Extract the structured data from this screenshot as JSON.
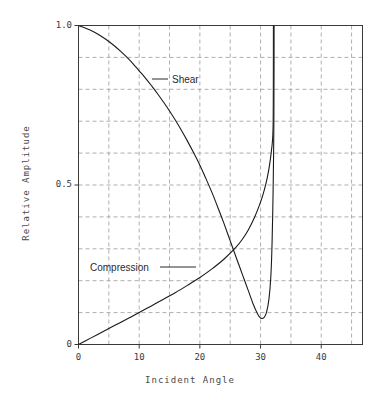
{
  "chart_data": {
    "type": "line",
    "title": "",
    "xlabel": "Incident Angle",
    "ylabel": "Relative Amplitude",
    "xlim": [
      0,
      46.8
    ],
    "ylim": [
      0,
      1.0
    ],
    "grid": true,
    "grid_x_step": 5,
    "grid_y_step": 0.1,
    "x_ticks": [
      0,
      10,
      20,
      30,
      40
    ],
    "x_tick_labels": [
      "0",
      "10",
      "20",
      "30",
      "40"
    ],
    "y_ticks": [
      0,
      0.5,
      1.0
    ],
    "y_tick_labels": [
      "0",
      "0.5",
      "1.0"
    ],
    "legend_position": "inline-annotations",
    "annotations": [
      {
        "name": "Shear",
        "label": "Shear",
        "label_x": 172,
        "label_y": 74,
        "leader_from_x": 152,
        "leader_from_y": 79,
        "leader_to_x": 168,
        "leader_to_y": 79
      },
      {
        "name": "Compression",
        "label": "Compression",
        "label_x": 90,
        "label_y": 262,
        "leader_from_x": 160,
        "leader_from_y": 267,
        "leader_to_x": 196,
        "leader_to_y": 267
      }
    ],
    "series": [
      {
        "name": "Shear",
        "color": "#1a1a1a",
        "points": [
          [
            0.0,
            1.0
          ],
          [
            1.0,
            0.993
          ],
          [
            2.0,
            0.985
          ],
          [
            3.0,
            0.975
          ],
          [
            4.0,
            0.963
          ],
          [
            5.0,
            0.95
          ],
          [
            6.0,
            0.935
          ],
          [
            7.0,
            0.918
          ],
          [
            8.0,
            0.9
          ],
          [
            9.0,
            0.88
          ],
          [
            10.0,
            0.858
          ],
          [
            11.0,
            0.836
          ],
          [
            12.0,
            0.812
          ],
          [
            13.0,
            0.787
          ],
          [
            14.0,
            0.76
          ],
          [
            15.0,
            0.732
          ],
          [
            16.0,
            0.702
          ],
          [
            17.0,
            0.67
          ],
          [
            18.0,
            0.636
          ],
          [
            19.0,
            0.6
          ],
          [
            20.0,
            0.562
          ],
          [
            21.0,
            0.52
          ],
          [
            22.0,
            0.476
          ],
          [
            23.0,
            0.428
          ],
          [
            24.0,
            0.378
          ],
          [
            25.0,
            0.325
          ],
          [
            26.0,
            0.272
          ],
          [
            27.0,
            0.22
          ],
          [
            28.0,
            0.168
          ],
          [
            28.8,
            0.126
          ],
          [
            29.4,
            0.1
          ],
          [
            30.0,
            0.083
          ],
          [
            30.6,
            0.085
          ],
          [
            31.0,
            0.102
          ],
          [
            31.4,
            0.145
          ],
          [
            31.7,
            0.215
          ],
          [
            31.9,
            0.32
          ],
          [
            32.05,
            0.46
          ],
          [
            32.15,
            0.6
          ],
          [
            32.2,
            0.72
          ],
          [
            32.22,
            0.85
          ],
          [
            32.23,
            1.0
          ]
        ]
      },
      {
        "name": "Compression",
        "color": "#1a1a1a",
        "points": [
          [
            0.0,
            0.0
          ],
          [
            2.0,
            0.02
          ],
          [
            4.0,
            0.04
          ],
          [
            6.0,
            0.06
          ],
          [
            8.0,
            0.08
          ],
          [
            10.0,
            0.1
          ],
          [
            12.0,
            0.121
          ],
          [
            14.0,
            0.142
          ],
          [
            16.0,
            0.163
          ],
          [
            18.0,
            0.186
          ],
          [
            20.0,
            0.21
          ],
          [
            22.0,
            0.237
          ],
          [
            24.0,
            0.268
          ],
          [
            26.0,
            0.306
          ],
          [
            27.0,
            0.33
          ],
          [
            28.0,
            0.36
          ],
          [
            29.0,
            0.398
          ],
          [
            29.8,
            0.436
          ],
          [
            30.4,
            0.47
          ],
          [
            30.9,
            0.505
          ],
          [
            31.3,
            0.542
          ],
          [
            31.6,
            0.578
          ],
          [
            31.8,
            0.608
          ],
          [
            31.95,
            0.635
          ],
          [
            32.03,
            0.66
          ],
          [
            32.08,
            0.7
          ],
          [
            32.1,
            0.76
          ],
          [
            32.11,
            0.85
          ],
          [
            32.12,
            1.0
          ]
        ]
      }
    ]
  }
}
